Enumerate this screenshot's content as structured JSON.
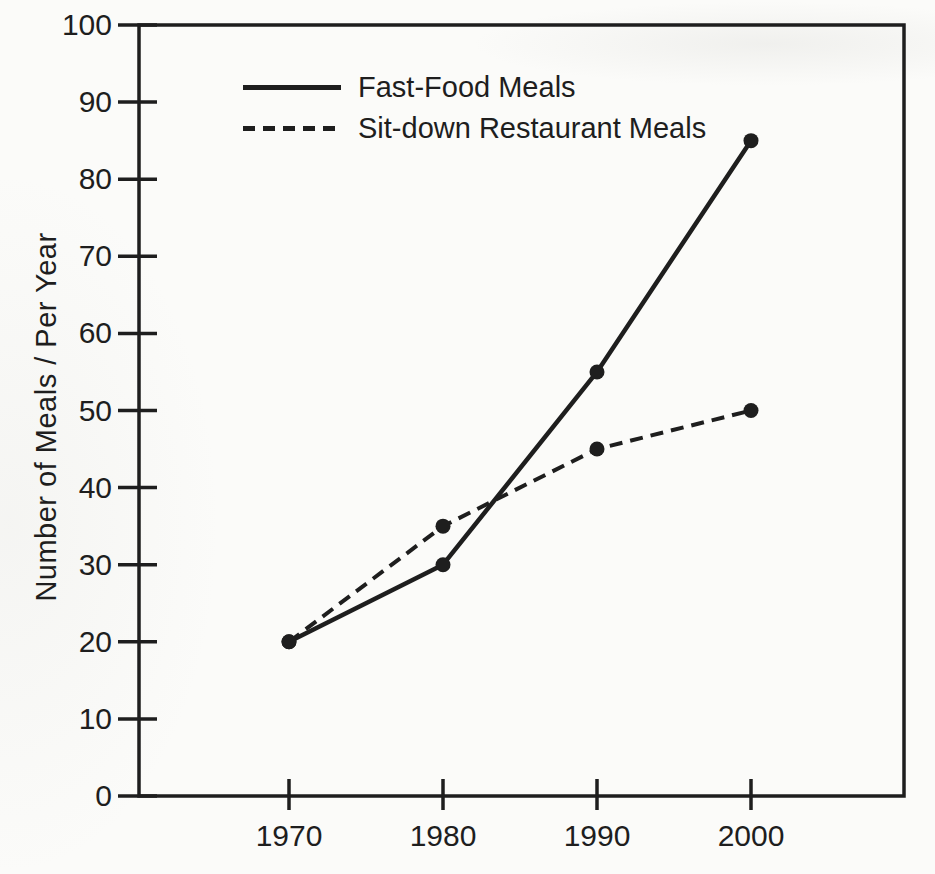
{
  "page": {
    "background_color": "#fbfbf9",
    "ink_color": "#1e1e1e"
  },
  "chart_data": {
    "type": "line",
    "title": "",
    "xlabel": "",
    "ylabel": "Number of Meals / Per Year",
    "x_tick_labels": [
      "1970",
      "1980",
      "1990",
      "2000"
    ],
    "y_ticks": [
      0,
      10,
      20,
      30,
      40,
      50,
      60,
      70,
      80,
      90,
      100
    ],
    "ylim": [
      0,
      100
    ],
    "grid": false,
    "frame": "full-box",
    "legend_position": "top-left-inside",
    "series": [
      {
        "name": "Fast-Food Meals",
        "line_style": "solid",
        "marker": "filled-circle",
        "color": "#1e1e1e",
        "values": [
          20,
          30,
          55,
          85
        ]
      },
      {
        "name": "Sit-down Restaurant Meals",
        "line_style": "dashed",
        "marker": "filled-circle",
        "color": "#1e1e1e",
        "values": [
          20,
          35,
          45,
          50
        ]
      }
    ]
  }
}
